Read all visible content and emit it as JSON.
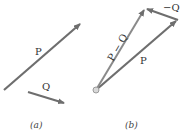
{
  "colors": {
    "vector": "#6e6e6e",
    "text": "#333333",
    "origin": "#bdbdbd"
  },
  "panel_a": {
    "caption": "(a)",
    "vectors": [
      {
        "label": "P",
        "from": [
          4,
          90
        ],
        "to": [
          82,
          22
        ]
      },
      {
        "label": "Q",
        "from": [
          28,
          92
        ],
        "to": [
          66,
          104
        ]
      }
    ]
  },
  "panel_b": {
    "caption": "(b)",
    "vectors": [
      {
        "label": "P",
        "from": [
          96,
          90
        ],
        "to": [
          178,
          20
        ]
      },
      {
        "label": "−Q",
        "from": [
          178,
          20
        ],
        "to": [
          145,
          8
        ]
      },
      {
        "label": "P − Q",
        "from": [
          96,
          90
        ],
        "to": [
          145,
          8
        ]
      }
    ]
  }
}
